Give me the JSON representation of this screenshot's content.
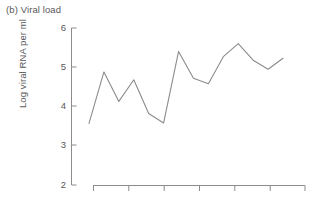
{
  "figure": {
    "panel_title": "(b) Viral load",
    "line_color": "#8c8c8c",
    "axis_color": "#8c8c8c",
    "text_color": "#58585a",
    "background": "#ffffff"
  },
  "chart_data": {
    "type": "line",
    "title": "(b) Viral load",
    "xlabel": "",
    "ylabel": "Log viral RNA per ml",
    "ylim": [
      2,
      6
    ],
    "ytick_labels": [
      "6",
      "5",
      "4",
      "3",
      "2"
    ],
    "ytick_values": [
      6,
      5,
      4,
      3,
      2
    ],
    "xtick_labels": [
      "",
      "",
      "",
      "",
      "",
      "",
      ""
    ],
    "xtick_count": 7,
    "grid": false,
    "legend": null,
    "markers": false,
    "series": [
      {
        "name": "Log viral RNA per ml",
        "x": [
          0,
          1,
          2,
          3,
          4,
          5,
          6,
          7,
          8,
          9,
          10,
          11,
          12,
          13
        ],
        "values": [
          3.57,
          4.88,
          4.13,
          4.68,
          3.82,
          3.58,
          5.4,
          4.72,
          4.58,
          5.27,
          5.6,
          5.18,
          4.95,
          5.23
        ]
      }
    ]
  },
  "axes": {
    "y_axis_name": "y-axis",
    "x_axis_name": "x-axis"
  }
}
